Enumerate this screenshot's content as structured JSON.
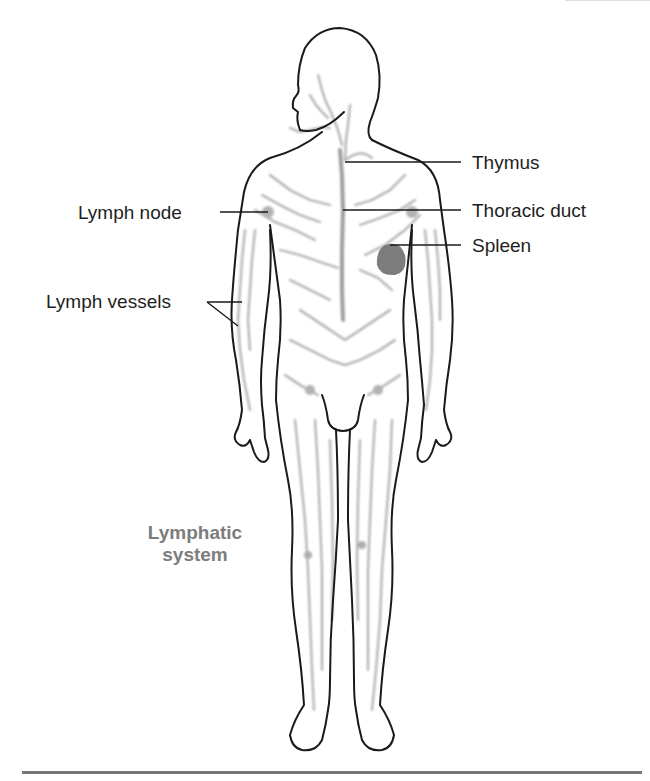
{
  "diagram": {
    "title_line1": "Lymphatic",
    "title_line2": "system",
    "labels": {
      "thymus": "Thymus",
      "thoracic_duct": "Thoracic duct",
      "spleen": "Spleen",
      "lymph_node": "Lymph node",
      "lymph_vessels": "Lymph vessels"
    },
    "colors": {
      "outline": "#1a1a1a",
      "lymph": "#9a9a9a",
      "spleen": "#6e6e6e",
      "title": "#7d7d7d",
      "rule": "#777777"
    }
  }
}
